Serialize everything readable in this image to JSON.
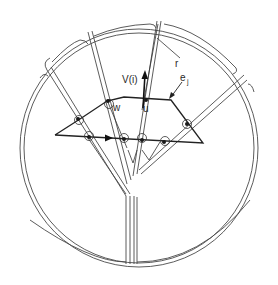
{
  "figure": {
    "type": "geometric-diagram",
    "colors": {
      "ink": "#222222",
      "background": "#ffffff"
    }
  },
  "labels": {
    "velocity": "V(i)",
    "ray": "r",
    "edge": "e",
    "edge_subscript": "j",
    "point_w": "w",
    "point_u": "u"
  },
  "markers": {
    "circled_intersections": 7,
    "direction_arrows": [
      "V(i) upward arrow",
      "polygon bottom-edge direction arrow"
    ]
  }
}
